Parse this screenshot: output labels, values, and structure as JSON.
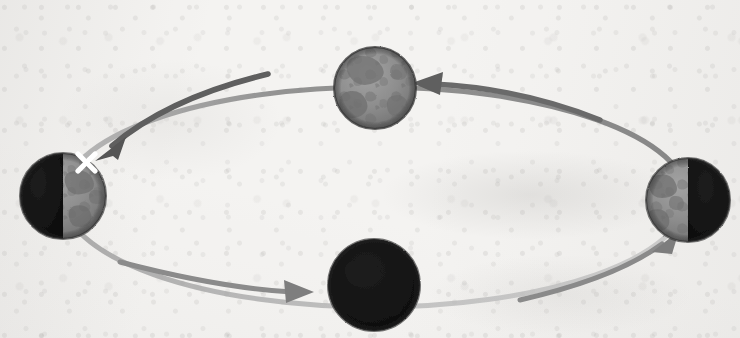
{
  "figure": {
    "medium": "scanned textbook line art, grayscale",
    "background_color": "#f5f4f2",
    "ink_color": "#4a4a4a",
    "lit_color": "#8c8c8c",
    "dark_color": "#141414",
    "marker_color": "#ffffff",
    "orbit": {
      "center_x": 375,
      "center_y": 197,
      "radius_x": 312,
      "radius_y": 110,
      "stroke_color": "#8e8e8e",
      "direction": "counterclockwise"
    },
    "bodies": [
      {
        "name": "top-body",
        "phase_label": "fully lit",
        "position": "top",
        "cx": 375,
        "cy": 88,
        "r": 41,
        "lit_fraction": 1.0,
        "lit_side": "full",
        "has_marker": false
      },
      {
        "name": "left-body",
        "phase_label": "right half lit",
        "position": "left",
        "cx": 63,
        "cy": 196,
        "r": 43,
        "lit_fraction": 0.5,
        "lit_side": "right",
        "has_marker": true,
        "marker": {
          "symbol": "X",
          "x": 86,
          "y": 162,
          "size": 17
        }
      },
      {
        "name": "bottom-body",
        "phase_label": "fully dark",
        "position": "bottom",
        "cx": 374,
        "cy": 285,
        "r": 46,
        "lit_fraction": 0.0,
        "lit_side": "none",
        "has_marker": false
      },
      {
        "name": "right-body",
        "phase_label": "left half lit",
        "position": "right",
        "cx": 688,
        "cy": 200,
        "r": 42,
        "lit_fraction": 0.5,
        "lit_side": "left",
        "has_marker": false
      }
    ],
    "arrows": [
      {
        "name": "arrow-right-to-top",
        "from": "right-body",
        "to": "top-body",
        "points": "left"
      },
      {
        "name": "arrow-top-to-left",
        "from": "top-body",
        "to": "left-body",
        "points": "down-left"
      },
      {
        "name": "arrow-left-to-bottom",
        "from": "left-body",
        "to": "bottom-body",
        "points": "right"
      },
      {
        "name": "arrow-bottom-to-right",
        "from": "bottom-body",
        "to": "right-body",
        "points": "up-right"
      }
    ],
    "labels": []
  }
}
